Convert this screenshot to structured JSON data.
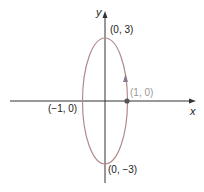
{
  "diagram": {
    "axes": {
      "x_label": "x",
      "y_label": "y"
    },
    "curve": {
      "type": "ellipse",
      "center": [
        0,
        0
      ],
      "rx": 1,
      "ry": 3,
      "color": "#b08a8a",
      "direction": "counterclockwise"
    },
    "points": [
      {
        "label": "(0, 3)"
      },
      {
        "label": "(1, 0)"
      },
      {
        "label": "(−1, 0)"
      },
      {
        "label": "(0, −3)"
      }
    ]
  }
}
